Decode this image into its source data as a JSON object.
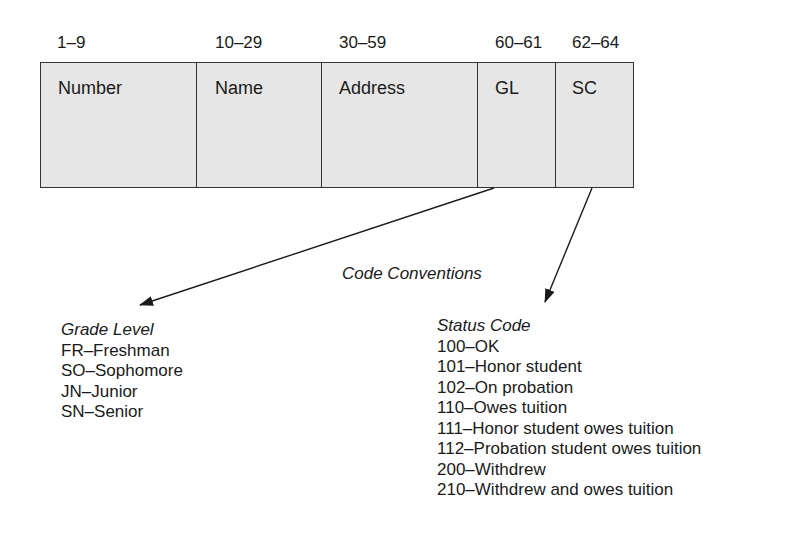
{
  "record_layout": {
    "fields": [
      {
        "positions": "1–9",
        "name": "Number"
      },
      {
        "positions": "10–29",
        "name": "Name"
      },
      {
        "positions": "30–59",
        "name": "Address"
      },
      {
        "positions": "60–61",
        "name": "GL"
      },
      {
        "positions": "62–64",
        "name": "SC"
      }
    ]
  },
  "code_conventions": {
    "title": "Code Conventions",
    "grade_level": {
      "title": "Grade Level",
      "items": [
        "FR–Freshman",
        "SO–Sophomore",
        "JN–Junior",
        "SN–Senior"
      ]
    },
    "status_code": {
      "title": "Status Code",
      "items": [
        "100–OK",
        "101–Honor student",
        "102–On probation",
        "110–Owes tuition",
        "111–Honor student owes tuition",
        "112–Probation student owes tuition",
        "200–Withdrew",
        "210–Withdrew and owes tuition"
      ]
    }
  },
  "arrows": [
    {
      "from": "GL",
      "to": "Grade Level"
    },
    {
      "from": "SC",
      "to": "Status Code"
    }
  ],
  "colors": {
    "field_fill": "#e6e6e6",
    "line": "#333333",
    "text": "#1a1a1a"
  }
}
